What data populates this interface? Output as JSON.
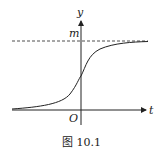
{
  "figure": {
    "caption": "图 10.1",
    "y_axis_label": "y",
    "x_axis_label": "t",
    "origin_label": "O",
    "asymptote_label": "m",
    "curve_type": "logistic (S-shaped) curve approaching horizontal asymptote y = m",
    "asymptote_style": "dashed",
    "colors": {
      "stroke": "#222222",
      "background": "#ffffff"
    }
  }
}
